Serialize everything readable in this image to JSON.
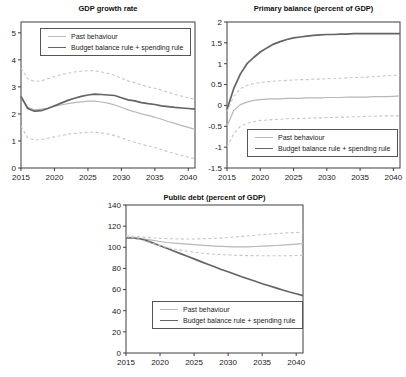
{
  "page": {
    "background": "#ffffff",
    "axis_color": "#3f3f3f",
    "text_color": "#1a1a1a"
  },
  "chart_data": [
    {
      "type": "line",
      "title": "GDP growth rate",
      "xlabel": "",
      "ylabel": "",
      "xlim": [
        2015,
        2041
      ],
      "ylim": [
        0,
        5.4
      ],
      "grid": false,
      "legend_position": "upper-left",
      "xticks": {
        "values": [
          2015,
          2020,
          2025,
          2030,
          2035,
          2040
        ],
        "labels": [
          "2015",
          "2020",
          "2025",
          "2030",
          "2035",
          "2040"
        ]
      },
      "yticks": {
        "values": [
          0,
          1,
          2,
          3,
          4,
          5
        ],
        "labels": [
          "0",
          "1",
          "2",
          "3",
          "4",
          "5"
        ]
      },
      "x": [
        2015,
        2016,
        2017,
        2018,
        2019,
        2020,
        2021,
        2022,
        2023,
        2024,
        2025,
        2026,
        2027,
        2028,
        2029,
        2030,
        2031,
        2032,
        2033,
        2034,
        2035,
        2036,
        2037,
        2038,
        2039,
        2040
      ],
      "series": [
        {
          "name": "Past behaviour",
          "color": "#b8b8b8",
          "dash": false,
          "width": 1.2,
          "in_legend": true,
          "values": [
            2.6,
            2.25,
            2.15,
            2.18,
            2.22,
            2.28,
            2.33,
            2.38,
            2.42,
            2.45,
            2.47,
            2.47,
            2.44,
            2.4,
            2.33,
            2.25,
            2.15,
            2.08,
            2.0,
            1.95,
            1.88,
            1.8,
            1.72,
            1.65,
            1.57,
            1.5
          ]
        },
        {
          "name": "Budget balance rule + spending rule",
          "color": "#646464",
          "dash": false,
          "width": 1.7,
          "in_legend": true,
          "values": [
            2.65,
            2.2,
            2.1,
            2.12,
            2.2,
            2.3,
            2.4,
            2.5,
            2.58,
            2.65,
            2.7,
            2.73,
            2.72,
            2.7,
            2.68,
            2.6,
            2.52,
            2.48,
            2.42,
            2.38,
            2.35,
            2.3,
            2.27,
            2.24,
            2.22,
            2.2
          ]
        },
        {
          "name": "upper-band-dashed",
          "color": "#c6c6c6",
          "dash": true,
          "width": 1.1,
          "in_legend": false,
          "values": [
            3.7,
            3.3,
            3.2,
            3.22,
            3.3,
            3.38,
            3.45,
            3.5,
            3.55,
            3.58,
            3.6,
            3.6,
            3.55,
            3.5,
            3.42,
            3.32,
            3.22,
            3.15,
            3.08,
            3.0,
            2.95,
            2.88,
            2.8,
            2.72,
            2.66,
            2.6
          ]
        },
        {
          "name": "lower-band-dashed",
          "color": "#c6c6c6",
          "dash": true,
          "width": 1.1,
          "in_legend": false,
          "values": [
            1.55,
            1.12,
            1.03,
            1.05,
            1.1,
            1.15,
            1.2,
            1.25,
            1.28,
            1.3,
            1.32,
            1.32,
            1.3,
            1.26,
            1.2,
            1.12,
            1.03,
            0.95,
            0.88,
            0.82,
            0.76,
            0.68,
            0.6,
            0.53,
            0.46,
            0.4
          ]
        }
      ]
    },
    {
      "type": "line",
      "title": "Primary balance (percent of GDP)",
      "xlabel": "",
      "ylabel": "",
      "xlim": [
        2015,
        2041
      ],
      "ylim": [
        -1.5,
        2
      ],
      "grid": false,
      "legend_position": "lower-right",
      "xticks": {
        "values": [
          2015,
          2020,
          2025,
          2030,
          2035,
          2040
        ],
        "labels": [
          "2015",
          "2020",
          "2025",
          "2030",
          "2035",
          "2040"
        ]
      },
      "yticks": {
        "values": [
          -1.5,
          -1,
          -0.5,
          0,
          0.5,
          1,
          1.5,
          2
        ],
        "labels": [
          "-1.5",
          "-1",
          "-0.5",
          "0",
          "0.5",
          "1",
          "1.5",
          "2"
        ]
      },
      "x": [
        2015,
        2016,
        2017,
        2018,
        2019,
        2020,
        2021,
        2022,
        2023,
        2024,
        2025,
        2026,
        2027,
        2028,
        2029,
        2030,
        2031,
        2032,
        2033,
        2034,
        2035,
        2036,
        2037,
        2038,
        2039,
        2040
      ],
      "series": [
        {
          "name": "Past behaviour",
          "color": "#b8b8b8",
          "dash": false,
          "width": 1.2,
          "in_legend": true,
          "values": [
            -0.5,
            -0.12,
            0.02,
            0.08,
            0.12,
            0.14,
            0.15,
            0.16,
            0.16,
            0.17,
            0.17,
            0.17,
            0.18,
            0.18,
            0.18,
            0.19,
            0.19,
            0.19,
            0.2,
            0.2,
            0.2,
            0.2,
            0.21,
            0.21,
            0.21,
            0.22
          ]
        },
        {
          "name": "Budget balance rule + spending rule",
          "color": "#646464",
          "dash": false,
          "width": 1.7,
          "in_legend": true,
          "values": [
            -0.1,
            0.4,
            0.75,
            1.0,
            1.15,
            1.28,
            1.38,
            1.47,
            1.53,
            1.58,
            1.62,
            1.64,
            1.66,
            1.68,
            1.69,
            1.7,
            1.7,
            1.71,
            1.71,
            1.72,
            1.72,
            1.72,
            1.72,
            1.72,
            1.72,
            1.72
          ]
        },
        {
          "name": "upper-band-dashed",
          "color": "#c6c6c6",
          "dash": true,
          "width": 1.1,
          "in_legend": false,
          "values": [
            -0.15,
            0.22,
            0.4,
            0.48,
            0.52,
            0.55,
            0.57,
            0.58,
            0.59,
            0.6,
            0.61,
            0.62,
            0.62,
            0.63,
            0.63,
            0.64,
            0.65,
            0.65,
            0.66,
            0.67,
            0.67,
            0.68,
            0.69,
            0.7,
            0.71,
            0.72
          ]
        },
        {
          "name": "lower-band-dashed",
          "color": "#c6c6c6",
          "dash": true,
          "width": 1.1,
          "in_legend": false,
          "values": [
            -1.0,
            -0.68,
            -0.5,
            -0.43,
            -0.39,
            -0.36,
            -0.35,
            -0.34,
            -0.33,
            -0.32,
            -0.32,
            -0.31,
            -0.31,
            -0.3,
            -0.3,
            -0.29,
            -0.29,
            -0.28,
            -0.28,
            -0.27,
            -0.27,
            -0.26,
            -0.26,
            -0.25,
            -0.25,
            -0.25
          ]
        }
      ]
    },
    {
      "type": "line",
      "title": "Public debt (percent of GDP)",
      "xlabel": "",
      "ylabel": "",
      "xlim": [
        2015,
        2041
      ],
      "ylim": [
        0,
        140
      ],
      "grid": false,
      "legend_position": "lower-center",
      "xticks": {
        "values": [
          2015,
          2020,
          2025,
          2030,
          2035,
          2040
        ],
        "labels": [
          "2015",
          "2020",
          "2025",
          "2030",
          "2035",
          "2040"
        ]
      },
      "yticks": {
        "values": [
          0,
          20,
          40,
          60,
          80,
          100,
          120,
          140
        ],
        "labels": [
          "0",
          "20",
          "40",
          "60",
          "80",
          "100",
          "120",
          "140"
        ]
      },
      "x": [
        2015,
        2016,
        2017,
        2018,
        2019,
        2020,
        2021,
        2022,
        2023,
        2024,
        2025,
        2026,
        2027,
        2028,
        2029,
        2030,
        2031,
        2032,
        2033,
        2034,
        2035,
        2036,
        2037,
        2038,
        2039,
        2040
      ],
      "series": [
        {
          "name": "Past behaviour",
          "color": "#b8b8b8",
          "dash": false,
          "width": 1.2,
          "in_legend": true,
          "values": [
            109.5,
            109.3,
            108.5,
            107.5,
            106.5,
            105.5,
            104.5,
            104,
            103.4,
            102.9,
            102.4,
            102,
            101.5,
            101.1,
            100.8,
            100.6,
            100.4,
            100.4,
            100.5,
            100.7,
            101,
            101.3,
            101.7,
            102.1,
            102.5,
            103
          ]
        },
        {
          "name": "Budget balance rule + spending rule",
          "color": "#646464",
          "dash": false,
          "width": 1.7,
          "in_legend": true,
          "values": [
            109,
            108.8,
            108,
            106.3,
            104,
            101.5,
            99,
            96.5,
            94,
            91.5,
            89,
            86.5,
            84,
            81.5,
            79,
            76.8,
            74.5,
            72.2,
            70,
            67.8,
            65.6,
            63.6,
            61.6,
            59.6,
            57.7,
            56
          ]
        },
        {
          "name": "upper-band-dashed",
          "color": "#c6c6c6",
          "dash": true,
          "width": 1.1,
          "in_legend": false,
          "values": [
            111,
            110.5,
            110,
            109.5,
            109,
            108.6,
            108.2,
            108,
            107.9,
            107.8,
            107.8,
            108,
            108.2,
            108.5,
            108.9,
            109.3,
            109.8,
            110.3,
            110.9,
            111.4,
            112,
            112.4,
            112.9,
            113.3,
            113.7,
            114
          ]
        },
        {
          "name": "lower-band-dashed",
          "color": "#c6c6c6",
          "dash": true,
          "width": 1.1,
          "in_legend": false,
          "values": [
            110,
            109,
            107.5,
            105.5,
            103.5,
            101.6,
            100,
            98.5,
            97.3,
            96.3,
            95.4,
            94.6,
            94,
            93.5,
            93.1,
            92.8,
            92.5,
            92.3,
            92.1,
            92,
            92,
            92,
            92,
            92,
            92,
            92.2
          ]
        }
      ]
    }
  ]
}
